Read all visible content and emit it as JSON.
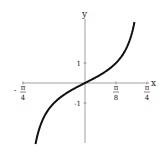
{
  "chart_data": {
    "type": "line",
    "title": "",
    "function": "y = tan(2x)",
    "xlabel": "x",
    "ylabel": "y",
    "x_ticks": [
      {
        "value": -0.7854,
        "label_num": "π",
        "label_den": "4",
        "sign": "-"
      },
      {
        "value": 0.3927,
        "label_num": "π",
        "label_den": "8",
        "sign": ""
      },
      {
        "value": 0.7854,
        "label_num": "π",
        "label_den": "4",
        "sign": ""
      }
    ],
    "y_ticks": [
      {
        "value": 1,
        "label": "1"
      },
      {
        "value": -1,
        "label": "-1"
      }
    ],
    "xlim": [
      -0.7854,
      0.7854
    ],
    "ylim": [
      -3.05,
      3.05
    ],
    "series": [
      {
        "name": "tan(2x)",
        "x_range": [
          -0.627,
          0.627
        ],
        "color": "#111111"
      }
    ],
    "grid": false,
    "legend": "none"
  }
}
